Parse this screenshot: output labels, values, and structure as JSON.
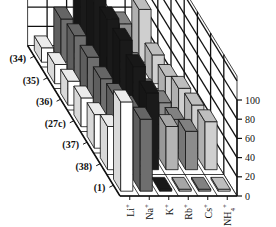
{
  "chart_data": {
    "type": "bar3d",
    "title": "",
    "xlabel": "",
    "ylabel": "",
    "zlabel": "",
    "categories": [
      "Li+",
      "Na+",
      "K+",
      "Rb+",
      "Cs+",
      "NH4+"
    ],
    "category_labels": [
      {
        "base": "Li",
        "sup": "+",
        "sub": ""
      },
      {
        "base": "Na",
        "sup": "+",
        "sub": ""
      },
      {
        "base": "K",
        "sup": "+",
        "sub": ""
      },
      {
        "base": "Rb",
        "sup": "+",
        "sub": ""
      },
      {
        "base": "Cs",
        "sup": "+",
        "sub": ""
      },
      {
        "base": "NH",
        "sup": "+",
        "sub": "4"
      }
    ],
    "series": [
      {
        "name": "(34)",
        "values": [
          15,
          45,
          70,
          50,
          40,
          55
        ]
      },
      {
        "name": "(35)",
        "values": [
          20,
          50,
          90,
          15,
          20,
          30
        ]
      },
      {
        "name": "(36)",
        "values": [
          25,
          50,
          90,
          15,
          15,
          30
        ]
      },
      {
        "name": "(27c)",
        "values": [
          30,
          50,
          90,
          20,
          25,
          40
        ]
      },
      {
        "name": "(37)",
        "values": [
          35,
          55,
          85,
          25,
          30,
          45
        ]
      },
      {
        "name": "(38)",
        "values": [
          45,
          65,
          80,
          45,
          40,
          50
        ]
      },
      {
        "name": "(1)",
        "values": [
          93,
          75,
          2,
          2,
          2,
          2
        ]
      }
    ],
    "zlim": [
      0,
      100
    ],
    "zticks": [
      0,
      20,
      40,
      60,
      80,
      100
    ],
    "grid": true,
    "legend": "none",
    "category_colors": [
      "#ffffff",
      "#6e6e6e",
      "#1a1a1a",
      "#b4b4b4",
      "#8c8c8c",
      "#cfcfcf"
    ]
  }
}
